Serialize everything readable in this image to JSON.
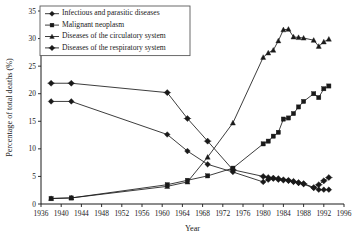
{
  "chart_data": {
    "type": "line",
    "title": "",
    "xlabel": "Year",
    "ylabel": "Percentage of total deaths (%)",
    "xlim": [
      1936,
      1996
    ],
    "ylim": [
      0,
      35
    ],
    "grid": false,
    "legend_position": "top-left",
    "xticks": [
      1936,
      1940,
      1944,
      1948,
      1952,
      1956,
      1960,
      1964,
      1968,
      1972,
      1976,
      1980,
      1984,
      1988,
      1992,
      1996
    ],
    "yticks": [
      0,
      5,
      10,
      15,
      20,
      25,
      30,
      35
    ],
    "series": [
      {
        "name": "Infectious and parasitic diseases",
        "marker": "diamond",
        "x": [
          1938,
          1942,
          1961,
          1965,
          1969,
          1974,
          1980,
          1981,
          1982,
          1983,
          1984,
          1985,
          1986,
          1987,
          1988,
          1990,
          1991,
          1992,
          1993
        ],
        "values": [
          18.6,
          18.6,
          12.6,
          9.6,
          7.2,
          5.8,
          4.0,
          4.4,
          4.6,
          4.4,
          4.3,
          4.2,
          4.0,
          3.8,
          3.6,
          2.9,
          2.6,
          2.6,
          2.6
        ]
      },
      {
        "name": "Malignant neoplasm",
        "marker": "square",
        "x": [
          1938,
          1942,
          1961,
          1965,
          1969,
          1974,
          1980,
          1981,
          1982,
          1983,
          1984,
          1985,
          1986,
          1987,
          1988,
          1990,
          1991,
          1992,
          1993
        ],
        "values": [
          1.0,
          1.1,
          3.5,
          4.3,
          5.1,
          6.5,
          10.9,
          11.4,
          12.3,
          13.0,
          15.4,
          15.6,
          16.4,
          17.6,
          18.6,
          20.0,
          19.3,
          20.9,
          21.4
        ]
      },
      {
        "name": "Diseases of the circulatory system",
        "marker": "triangle",
        "x": [
          1938,
          1942,
          1961,
          1965,
          1969,
          1974,
          1980,
          1981,
          1982,
          1983,
          1984,
          1985,
          1986,
          1987,
          1988,
          1990,
          1991,
          1992,
          1993
        ],
        "values": [
          1.0,
          1.1,
          3.2,
          4.0,
          8.5,
          14.7,
          26.6,
          27.4,
          27.9,
          29.6,
          31.6,
          31.7,
          30.3,
          30.2,
          30.1,
          29.7,
          28.6,
          29.4,
          29.9
        ]
      },
      {
        "name": "Diseases of the respiratory system",
        "marker": "plus-diamond",
        "x": [
          1938,
          1942,
          1961,
          1965,
          1969,
          1974,
          1980,
          1981,
          1982,
          1983,
          1984,
          1985,
          1986,
          1987,
          1988,
          1990,
          1991,
          1992,
          1993
        ],
        "values": [
          21.9,
          21.9,
          20.2,
          15.5,
          11.4,
          6.2,
          5.0,
          4.8,
          4.7,
          4.6,
          4.4,
          4.3,
          4.1,
          3.9,
          3.7,
          3.0,
          3.5,
          4.2,
          4.8
        ]
      }
    ]
  }
}
